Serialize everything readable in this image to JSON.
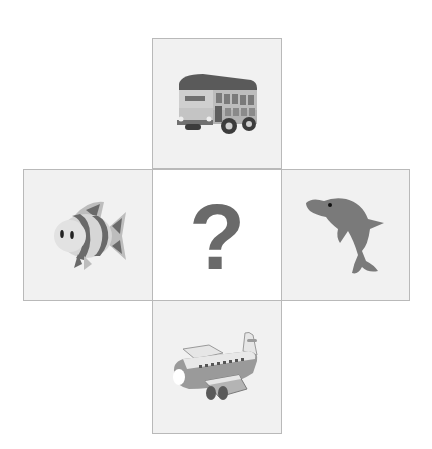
{
  "puzzle": {
    "tiles": [
      {
        "position": "top",
        "icon": "bus-icon",
        "label": "double-decker bus"
      },
      {
        "position": "left",
        "icon": "fish-icon",
        "label": "striped fish"
      },
      {
        "position": "center",
        "icon": "question-mark",
        "label": "?"
      },
      {
        "position": "right",
        "icon": "dolphin-icon",
        "label": "dolphin"
      },
      {
        "position": "bottom",
        "icon": "airplane-icon",
        "label": "airplane"
      }
    ],
    "center_text": "?"
  },
  "colors": {
    "tile_bg": "#f1f1f1",
    "tile_border": "#b9b9b9",
    "center_bg": "#ffffff",
    "glyph": "#6a6a6a"
  }
}
